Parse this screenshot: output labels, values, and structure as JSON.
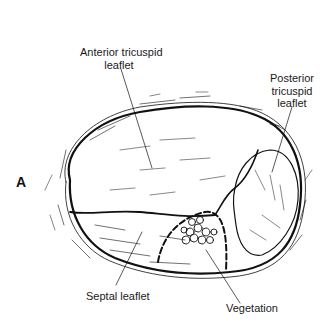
{
  "figure": {
    "panel_letter": "A",
    "labels": {
      "anterior": [
        "Anterior tricuspid",
        "leaflet"
      ],
      "posterior": [
        "Posterior",
        "tricuspid",
        "leaflet"
      ],
      "septal": "Septal leaflet",
      "vegetation": "Vegetation"
    },
    "colors": {
      "ink": "#111111",
      "background": "#ffffff"
    }
  }
}
